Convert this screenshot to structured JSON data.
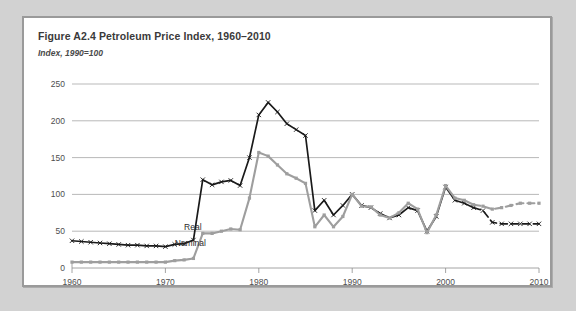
{
  "figure": {
    "title": "Figure A2.4  Petroleum Price Index, 1960–2010",
    "subtitle": "Index, 1990=100"
  },
  "colors": {
    "panel_background": "#ffffff",
    "page_background": "#d2d2d2",
    "panel_border": "#9a9a9a",
    "real_series": "#1a1a1a",
    "nominal_series": "#9e9e9e",
    "gridline": "#9b9b9b",
    "text": "#3a3a3a"
  },
  "chart_data": {
    "type": "line",
    "title": "Figure A2.4  Petroleum Price Index, 1960–2010",
    "subtitle": "Index, 1990=100",
    "xlabel": "",
    "ylabel": "Index, 1990=100",
    "xlim": [
      1960,
      2010
    ],
    "ylim": [
      0,
      250
    ],
    "yticks": [
      0,
      50,
      100,
      150,
      200,
      250
    ],
    "xticks": [
      1960,
      1970,
      1980,
      1990,
      2000,
      2010
    ],
    "grid": true,
    "legend_position": "inline-annotation",
    "annotations": [
      {
        "text": "Real",
        "x": 1972,
        "y": 52
      },
      {
        "text": "Nominal",
        "x": 1971,
        "y": 30
      }
    ],
    "x": [
      1960,
      1961,
      1962,
      1963,
      1964,
      1965,
      1966,
      1967,
      1968,
      1969,
      1970,
      1971,
      1972,
      1973,
      1974,
      1975,
      1976,
      1977,
      1978,
      1979,
      1980,
      1981,
      1982,
      1983,
      1984,
      1985,
      1986,
      1987,
      1988,
      1989,
      1990,
      1991,
      1992,
      1993,
      1994,
      1995,
      1996,
      1997,
      1998,
      1999,
      2000,
      2001,
      2002,
      2003,
      2004,
      2005,
      2006,
      2007,
      2008,
      2009,
      2010
    ],
    "series": [
      {
        "name": "Real",
        "style": "solid-with-x-markers",
        "color": "#1a1a1a",
        "values": [
          37,
          36,
          35,
          34,
          33,
          32,
          31,
          31,
          30,
          30,
          29,
          32,
          33,
          38,
          120,
          113,
          117,
          119,
          112,
          150,
          208,
          225,
          212,
          196,
          188,
          180,
          78,
          92,
          72,
          85,
          100,
          85,
          82,
          74,
          68,
          72,
          82,
          78,
          50,
          70,
          110,
          92,
          88,
          82,
          78,
          62,
          60,
          60,
          60,
          60,
          60
        ],
        "projection_from": 2003
      },
      {
        "name": "Nominal",
        "style": "solid-with-square-markers",
        "color": "#9e9e9e",
        "values": [
          8,
          8,
          8,
          8,
          8,
          8,
          8,
          8,
          8,
          8,
          8,
          10,
          11,
          13,
          47,
          47,
          50,
          53,
          52,
          95,
          157,
          152,
          140,
          128,
          122,
          115,
          56,
          72,
          56,
          70,
          100,
          84,
          83,
          72,
          68,
          75,
          88,
          80,
          48,
          72,
          112,
          95,
          92,
          86,
          84,
          80,
          82,
          85,
          88,
          88,
          88
        ],
        "projection_from": 2003
      }
    ]
  }
}
